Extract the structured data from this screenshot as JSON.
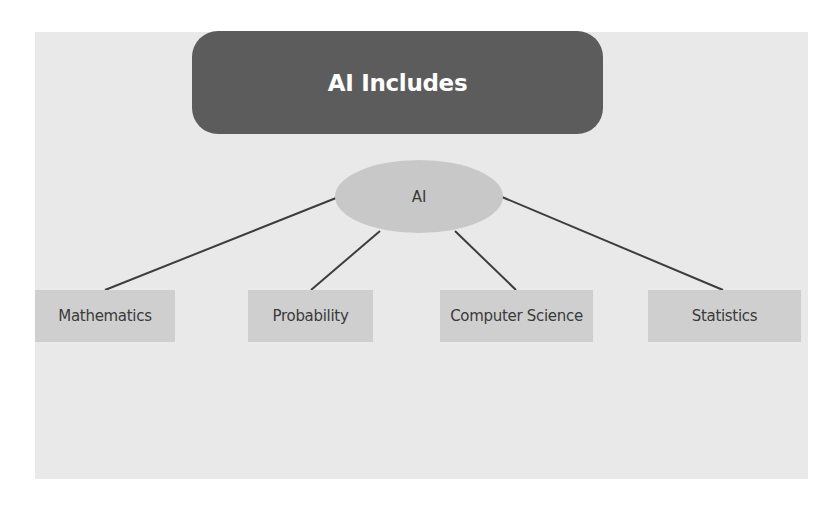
{
  "title": "AI Includes",
  "root": {
    "label": "AI"
  },
  "children": [
    {
      "label": "Mathematics"
    },
    {
      "label": "Probability"
    },
    {
      "label": "Computer Science"
    },
    {
      "label": "Statistics"
    }
  ],
  "colors": {
    "panel": "#e9e9e9",
    "title_box": "#5c5c5c",
    "title_text": "#ffffff",
    "root_node": "#c8c8c8",
    "leaf_box": "#cfcfcf",
    "connector": "#3d3d3d",
    "node_text": "#3a3a3a"
  }
}
